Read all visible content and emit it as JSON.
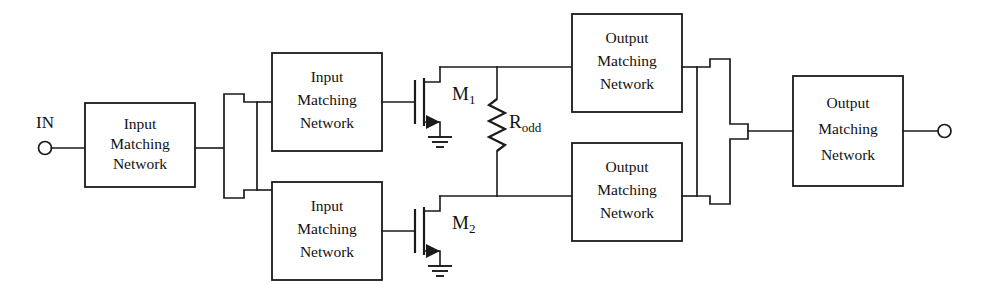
{
  "diagram": {
    "line_color": "#1a1a1a",
    "background_color": "#ffffff"
  },
  "ports": {
    "input": {
      "label": "IN",
      "terminal_name": "input-terminal"
    },
    "output": {
      "label": "",
      "terminal_name": "output-terminal"
    }
  },
  "blocks": {
    "input_stage": {
      "line1": "Input",
      "line2": "Matching",
      "line3": "Network"
    },
    "input_top": {
      "line1": "Input",
      "line2": "Matching",
      "line3": "Network"
    },
    "input_bottom": {
      "line1": "Input",
      "line2": "Matching",
      "line3": "Network"
    },
    "output_top": {
      "line1": "Output",
      "line2": "Matching",
      "line3": "Network"
    },
    "output_bottom": {
      "line1": "Output",
      "line2": "Matching",
      "line3": "Network"
    },
    "output_stage": {
      "line1": "Output",
      "line2": "Matching",
      "line3": "Network"
    }
  },
  "devices": {
    "transistor_top": {
      "label_main": "M",
      "label_sub": "1",
      "type": "mosfet"
    },
    "transistor_bottom": {
      "label_main": "M",
      "label_sub": "2",
      "type": "mosfet"
    },
    "resistor_odd": {
      "label_main": "R",
      "label_sub": "odd",
      "type": "resistor"
    }
  },
  "couplers": {
    "splitter": {
      "name": "input-power-splitter"
    },
    "combiner": {
      "name": "output-power-combiner"
    }
  },
  "grounds": {
    "top": {
      "name": "ground-symbol-m1"
    },
    "bottom": {
      "name": "ground-symbol-m2"
    }
  }
}
